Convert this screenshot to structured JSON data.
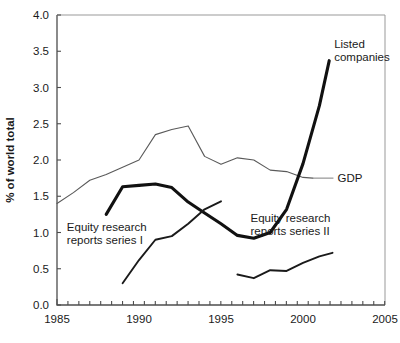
{
  "chart_data": {
    "type": "line",
    "title": "",
    "xlabel": "",
    "ylabel": "% of world total",
    "xlim": [
      1985,
      2005
    ],
    "ylim": [
      0.0,
      4.0
    ],
    "xticks": [
      1985,
      1990,
      1995,
      2000,
      2005
    ],
    "xtick_labels": [
      "1985",
      "1990",
      "1995",
      "2000",
      "2005"
    ],
    "yticks": [
      0.0,
      0.5,
      1.0,
      1.5,
      2.0,
      2.5,
      3.0,
      3.5,
      4.0
    ],
    "ytick_labels": [
      "0.0",
      "0.5",
      "1.0",
      "1.5",
      "2.0",
      "2.5",
      "3.0",
      "3.5",
      "4.0"
    ],
    "x_minor_tick_interval": 0.666,
    "grid": false,
    "legend": "inline-annotations",
    "series": [
      {
        "name": "GDP",
        "style": "thin",
        "color": "#5a5a5a",
        "width": 1.1,
        "points": [
          [
            1985.0,
            1.4
          ],
          [
            1986.0,
            1.55
          ],
          [
            1987.0,
            1.72
          ],
          [
            1988.0,
            1.8
          ],
          [
            1989.0,
            1.9
          ],
          [
            1990.0,
            2.0
          ],
          [
            1991.0,
            2.35
          ],
          [
            1992.0,
            2.42
          ],
          [
            1993.0,
            2.47
          ],
          [
            1994.0,
            2.05
          ],
          [
            1995.0,
            1.94
          ],
          [
            1996.0,
            2.03
          ],
          [
            1997.0,
            2.0
          ],
          [
            1998.0,
            1.86
          ],
          [
            1999.0,
            1.84
          ],
          [
            2000.0,
            1.76
          ],
          [
            2000.6,
            1.75
          ]
        ]
      },
      {
        "name": "Listed companies",
        "style": "thick",
        "color": "#111111",
        "width": 3.1,
        "points": [
          [
            1988.0,
            1.25
          ],
          [
            1989.0,
            1.63
          ],
          [
            1990.0,
            1.65
          ],
          [
            1991.0,
            1.67
          ],
          [
            1992.0,
            1.62
          ],
          [
            1993.0,
            1.42
          ],
          [
            1994.0,
            1.27
          ],
          [
            1995.0,
            1.12
          ],
          [
            1996.0,
            0.96
          ],
          [
            1997.0,
            0.92
          ],
          [
            1998.0,
            1.0
          ],
          [
            1999.0,
            1.32
          ],
          [
            2000.0,
            1.95
          ],
          [
            2001.0,
            2.75
          ],
          [
            2001.6,
            3.37
          ]
        ]
      },
      {
        "name": "Equity research reports series I",
        "style": "medium",
        "color": "#1a1a1a",
        "width": 1.9,
        "points": [
          [
            1989.0,
            0.3
          ],
          [
            1990.0,
            0.62
          ],
          [
            1991.0,
            0.9
          ],
          [
            1992.0,
            0.95
          ],
          [
            1993.0,
            1.12
          ],
          [
            1994.0,
            1.32
          ],
          [
            1995.0,
            1.43
          ]
        ]
      },
      {
        "name": "Equity research reports series II",
        "style": "medium",
        "color": "#1a1a1a",
        "width": 1.9,
        "points": [
          [
            1996.0,
            0.42
          ],
          [
            1997.0,
            0.37
          ],
          [
            1998.0,
            0.48
          ],
          [
            1999.0,
            0.47
          ],
          [
            2000.0,
            0.58
          ],
          [
            2001.0,
            0.67
          ],
          [
            2001.8,
            0.72
          ]
        ]
      }
    ],
    "annotations": [
      {
        "id": "listed-companies",
        "text_line1": "Listed",
        "text_line2": "companies",
        "x": 2001.9,
        "y": 3.55
      },
      {
        "id": "gdp",
        "text": "GDP",
        "x": 2002.1,
        "y": 1.75
      },
      {
        "id": "series-one",
        "text_line1": "Equity research",
        "text_line2": "reports series I",
        "x": 1985.6,
        "y": 1.02
      },
      {
        "id": "series-two",
        "text_line1": "Equity research",
        "text_line2": "reports series II",
        "x": 1996.8,
        "y": 1.15
      }
    ]
  }
}
